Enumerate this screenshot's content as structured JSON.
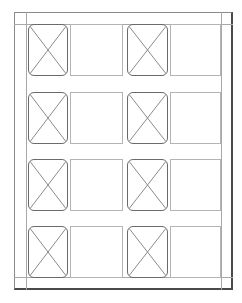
{
  "diagram": {
    "type": "wireframe-grid",
    "rows": 4,
    "columns": 4,
    "column_pattern": [
      "image-placeholder",
      "blank-box",
      "image-placeholder",
      "blank-box"
    ],
    "colors": {
      "frame": "#4a4a4a",
      "guide_lines": "#a8a8a8",
      "placeholder_border": "#6a6a6a",
      "placeholder_cross": "#8a8a8a",
      "blank_border": "#b4b4b4",
      "background": "#ffffff"
    }
  }
}
